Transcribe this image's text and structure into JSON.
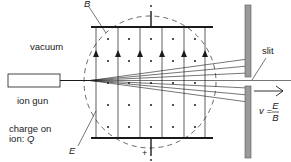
{
  "diagram": {
    "labels": {
      "magnetic_field": "B",
      "region": "vacuum",
      "source": "ion gun",
      "charge_line1": "charge on",
      "charge_line2_prefix": "ion: ",
      "charge_symbol": "Q",
      "electric_field": "E",
      "slit": "slit",
      "velocity_lhs": "v =",
      "velocity_num": "E",
      "velocity_den": "B",
      "top_plate_sign": "−",
      "bottom_plate_sign": "+"
    },
    "colors": {
      "line": "#1a1a1a",
      "screen_fill": "#9a9a9a",
      "screen_border": "#555555",
      "dashed_circle": "#444444"
    },
    "field_lines_x": [
      96,
      118,
      140,
      162,
      184,
      205
    ],
    "field_direction": "up",
    "b_field_direction": "out of page (dots)",
    "beam_fan_count": 7
  }
}
